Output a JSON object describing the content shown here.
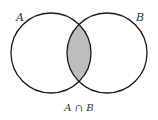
{
  "diagram": {
    "type": "venn",
    "sets": [
      {
        "label": "A",
        "cx": 51,
        "cy": 53,
        "r": 40
      },
      {
        "label": "B",
        "cx": 107,
        "cy": 53,
        "r": 40
      }
    ],
    "highlighted_region": "intersection",
    "caption": "A ∩ B",
    "colors": {
      "stroke": "#1a1a1a",
      "fill_highlight": "#bdbdbd",
      "background": "#ffffff"
    }
  }
}
